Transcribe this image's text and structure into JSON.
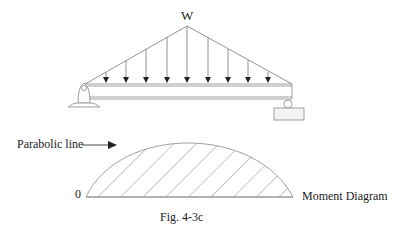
{
  "diagram": {
    "load_label": "W",
    "parabola_label": "Parabolic line",
    "origin_label": "0",
    "moment_label": "Moment Diagram",
    "caption": "Fig. 4-3c",
    "line_color": "#555555"
  }
}
